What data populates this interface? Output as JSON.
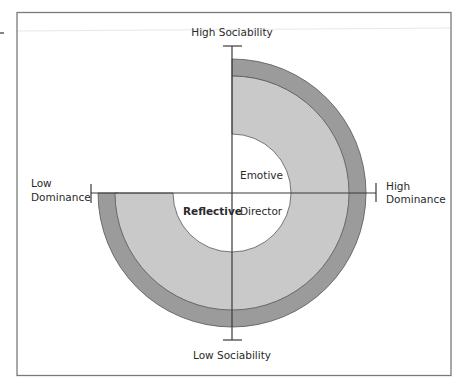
{
  "diagram": {
    "type": "quadrant-ring-diagram",
    "axes": {
      "top": "High Sociability",
      "bottom": "Low Sociability",
      "left_line1": "Low",
      "left_line2": "Dominance",
      "right_line1": "High",
      "right_line2": "Dominance"
    },
    "quadrants": {
      "top_right": "Emotive",
      "bottom_right": "Director",
      "bottom_left": "Reflective"
    },
    "colors": {
      "outer_ring": "#9b9b9b",
      "inner_ring": "#c9c9c9",
      "center": "#ffffff",
      "line": "#3a3a3a",
      "frame": "#7a7a7a"
    }
  }
}
